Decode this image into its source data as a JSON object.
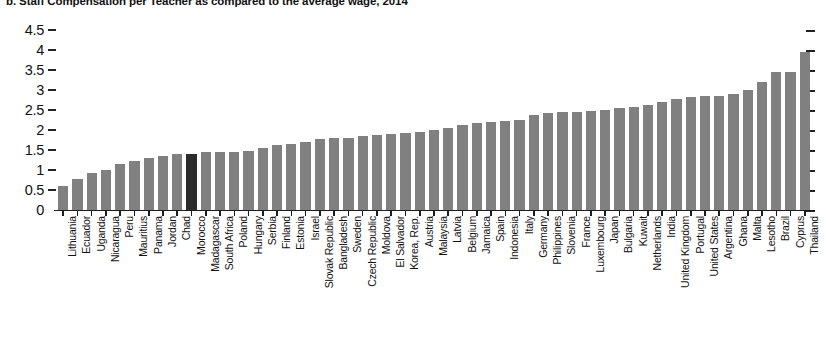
{
  "chart_data": {
    "type": "bar",
    "title": "b. Staff Compensation per Teacher as compared to the average wage, 2014",
    "xlabel": "",
    "ylabel": "",
    "ylim": [
      0,
      4.5
    ],
    "yticks": [
      0,
      0.5,
      1,
      1.5,
      2,
      2.5,
      3,
      3.5,
      4,
      4.5
    ],
    "ytick_labels": [
      "0",
      "0.5",
      "1",
      "1.5",
      "2",
      "2.5",
      "3",
      "3.5",
      "4",
      "4.5"
    ],
    "grid": false,
    "legend": "none",
    "bar_color": "#808080",
    "highlight_color": "#2b2b2b",
    "highlight_category": "Morocco",
    "categories": [
      "Lithuania",
      "Ecuador",
      "Uganda",
      "Nicaragua",
      "Peru",
      "Mauritius",
      "Panama",
      "Jordan",
      "Chad",
      "Morocco",
      "Madagascar",
      "South Africa",
      "Poland",
      "Hungary",
      "Serbia",
      "Finland",
      "Estonia",
      "Israel",
      "Slovak Republic",
      "Bangladesh",
      "Sweden",
      "Czech Republic",
      "Moldova",
      "El Salvador",
      "Korea, Rep.",
      "Austria",
      "Malaysia",
      "Latvia",
      "Belgium",
      "Jamaica",
      "Spain",
      "Indonesia",
      "Italy",
      "Germany",
      "Philippines",
      "Slovenia",
      "France",
      "Luxembourg",
      "Japan",
      "Bulgaria",
      "Kuwait",
      "Netherlands",
      "India",
      "United Kingdom",
      "Portugal",
      "United States",
      "Argentina",
      "Ghana",
      "Malta",
      "Lesotho",
      "Brazil",
      "Cyprus",
      "Thailand"
    ],
    "values": [
      0.6,
      0.78,
      0.92,
      1.0,
      1.14,
      1.22,
      1.3,
      1.35,
      1.4,
      1.39,
      1.44,
      1.45,
      1.46,
      1.47,
      1.55,
      1.62,
      1.66,
      1.7,
      1.78,
      1.8,
      1.8,
      1.84,
      1.88,
      1.9,
      1.92,
      1.96,
      1.99,
      2.05,
      2.12,
      2.18,
      2.2,
      2.22,
      2.25,
      2.38,
      2.42,
      2.44,
      2.46,
      2.48,
      2.5,
      2.55,
      2.58,
      2.62,
      2.7,
      2.78,
      2.82,
      2.84,
      2.86,
      2.9,
      3.0,
      3.2,
      3.45,
      3.46,
      3.95
    ]
  }
}
